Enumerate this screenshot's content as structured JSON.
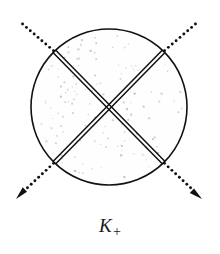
{
  "figure": {
    "caption_base": "K",
    "caption_subscript": "+",
    "caption_full": "K+",
    "background_color": "#ffffff",
    "ink_color": "#111111",
    "stipple_color": "#b9b9b9",
    "disk_fill_color": "#fefefe"
  },
  "chart_data": {
    "type": "diagram",
    "title": "K+",
    "canvas": {
      "width": 220,
      "height": 254
    },
    "disk": {
      "cx": 109,
      "cy": 107,
      "r": 78,
      "stroke": "#111111",
      "stroke_width": 1.6,
      "fill": "#fefefe",
      "stipple": true,
      "stipple_dots": 150
    },
    "junction_points": [
      {
        "id": "top-left",
        "x": 55,
        "y": 52
      },
      {
        "id": "top-right",
        "x": 163,
        "y": 52
      },
      {
        "id": "bottom-left",
        "x": 55,
        "y": 162
      },
      {
        "id": "bottom-right",
        "x": 163,
        "y": 162
      }
    ],
    "chords": [
      {
        "id": "chord-tl-br",
        "from": "top-left",
        "to": "bottom-right",
        "style": "double-line",
        "gap": 3.6,
        "stroke_width": 1.5
      },
      {
        "id": "chord-tr-bl",
        "from": "top-right",
        "to": "bottom-left",
        "style": "double-line",
        "gap": 3.6,
        "stroke_width": 1.5
      }
    ],
    "rays": [
      {
        "id": "ray-upper-left",
        "from": {
          "x": 55,
          "y": 52
        },
        "to": {
          "x": 19,
          "y": 21
        },
        "style": "dotted",
        "dot_radius": 1.45,
        "dot_spacing": 5.1,
        "arrowhead": false
      },
      {
        "id": "ray-upper-right",
        "from": {
          "x": 163,
          "y": 52
        },
        "to": {
          "x": 199,
          "y": 21
        },
        "style": "dotted",
        "dot_radius": 1.45,
        "dot_spacing": 5.1,
        "arrowhead": false
      },
      {
        "id": "ray-lower-left",
        "from": {
          "x": 55,
          "y": 162
        },
        "to": {
          "x": 24,
          "y": 191
        },
        "style": "dotted",
        "dot_radius": 1.45,
        "dot_spacing": 5.1,
        "arrowhead": true,
        "arrow_tip": {
          "x": 16,
          "y": 199
        },
        "arrow_length": 13,
        "arrow_width": 8
      },
      {
        "id": "ray-lower-right",
        "from": {
          "x": 163,
          "y": 162
        },
        "to": {
          "x": 194,
          "y": 191
        },
        "style": "dotted",
        "dot_radius": 1.45,
        "dot_spacing": 5.1,
        "arrowhead": true,
        "arrow_tip": {
          "x": 202,
          "y": 199
        },
        "arrow_length": 13,
        "arrow_width": 8
      }
    ],
    "label": {
      "text": "K+",
      "base": "K",
      "subscript": "+",
      "x": 110,
      "y": 232,
      "style": "italic-serif"
    }
  }
}
